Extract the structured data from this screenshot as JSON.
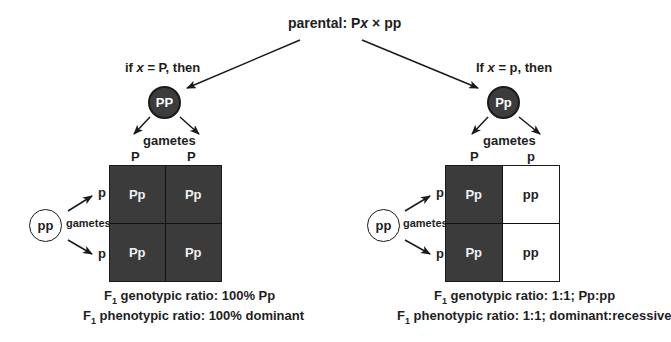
{
  "parental": {
    "prefix": "parental: P",
    "x": "x",
    "times": " × ",
    "suffix": "pp"
  },
  "left": {
    "condition": {
      "prefix": "if ",
      "x": "x",
      "rest": " = P, then"
    },
    "parent_genotype": "PP",
    "gametes_label": "gametes",
    "column_alleles": [
      "P",
      "P"
    ],
    "row_alleles": [
      "p",
      "p"
    ],
    "recessive_parent": "pp",
    "recessive_gametes_label": "gametes",
    "cells": [
      {
        "genotype": "Pp",
        "phenotype": "dominant"
      },
      {
        "genotype": "Pp",
        "phenotype": "dominant"
      },
      {
        "genotype": "Pp",
        "phenotype": "dominant"
      },
      {
        "genotype": "Pp",
        "phenotype": "dominant"
      }
    ],
    "genotypic_ratio": {
      "f": "F",
      "sub": "1",
      "text": " genotypic ratio: 100% Pp"
    },
    "phenotypic_ratio": {
      "f": "F",
      "sub": "1",
      "text": " phenotypic ratio: 100% dominant"
    }
  },
  "right": {
    "condition": {
      "prefix": "If ",
      "x": "x",
      "rest": " = p, then"
    },
    "parent_genotype": "Pp",
    "gametes_label": "gametes",
    "column_alleles": [
      "P",
      "p"
    ],
    "row_alleles": [
      "p",
      "p"
    ],
    "recessive_parent": "pp",
    "recessive_gametes_label": "gametes",
    "cells": [
      {
        "genotype": "Pp",
        "phenotype": "dominant"
      },
      {
        "genotype": "pp",
        "phenotype": "recessive"
      },
      {
        "genotype": "Pp",
        "phenotype": "dominant"
      },
      {
        "genotype": "pp",
        "phenotype": "recessive"
      }
    ],
    "genotypic_ratio": {
      "f": "F",
      "sub": "1",
      "text": " genotypic ratio: 1:1; Pp:pp"
    },
    "phenotypic_ratio": {
      "f": "F",
      "sub": "1",
      "text": " phenotypic ratio: 1:1; dominant:recessive"
    }
  },
  "colors": {
    "dominant": "#3b3b3b",
    "recessive": "#ffffff",
    "line": "#1a1a1a"
  }
}
